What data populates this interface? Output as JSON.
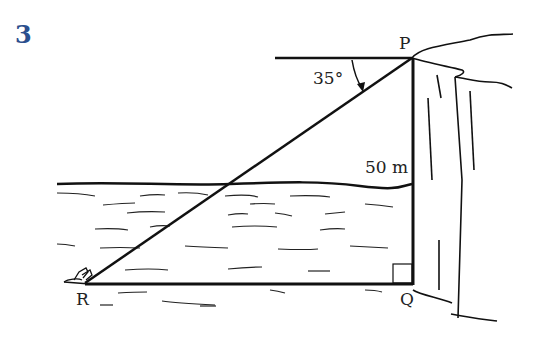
{
  "question": {
    "number": "3"
  },
  "figure": {
    "points": {
      "P": {
        "label": "P",
        "x": 412,
        "y": 58
      },
      "Q": {
        "label": "Q",
        "x": 412,
        "y": 283
      },
      "R": {
        "label": "R",
        "x": 85,
        "y": 283
      }
    },
    "angle_of_depression": {
      "label": "35°",
      "vertex": "P"
    },
    "height": {
      "label": "50 m",
      "segment": "PQ"
    },
    "right_angle_at": "Q",
    "scene": [
      "cliff",
      "sea",
      "swimmer"
    ]
  }
}
